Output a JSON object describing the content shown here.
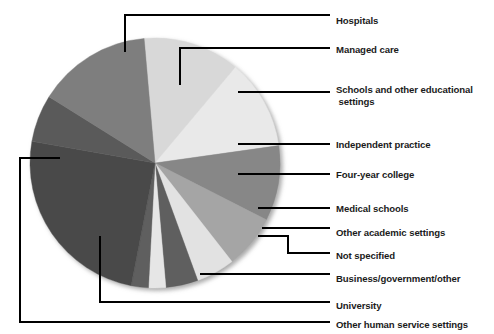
{
  "figure": {
    "background_color": "#ffffff",
    "text_color": "#1b1b1b",
    "leader_line_color": "#000000"
  },
  "chart_data": {
    "type": "pie",
    "title": "",
    "subtitle": "",
    "xlabel": "",
    "ylabel": "",
    "legend_position": "right-callouts",
    "grid": false,
    "start_angle_deg": -90,
    "direction": "counterclockwise",
    "center_px": [
      155,
      163
    ],
    "radius_px": 125,
    "categories": [
      "Hospitals",
      "Managed care",
      "Schools and other educational settings",
      "Independent practice",
      "Four-year college",
      "Medical schools",
      "Other academic settings",
      "Not specified",
      "Business/government/other",
      "University",
      "Other human service settings"
    ],
    "values": [
      12,
      8,
      12,
      7,
      5,
      4,
      2,
      2,
      11,
      26,
      11
    ],
    "units": "percent",
    "slices": [
      {
        "label": "Hospitals",
        "value": 12,
        "color": "#d8d8d8",
        "start_deg": 265,
        "end_deg": 310
      },
      {
        "label": "Managed care",
        "value": 8,
        "color": "#e9e9e9",
        "start_deg": 310,
        "end_deg": 352
      },
      {
        "label": "Schools and other educational settings",
        "value": 12,
        "color": "#878787",
        "start_deg": 352,
        "end_deg": 27
      },
      {
        "label": "Independent practice",
        "value": 7,
        "color": "#a5a5a5",
        "start_deg": 27,
        "end_deg": 52
      },
      {
        "label": "Four-year college",
        "value": 5,
        "color": "#e2e2e2",
        "start_deg": 52,
        "end_deg": 70
      },
      {
        "label": "Medical schools",
        "value": 4,
        "color": "#5e5e5e",
        "start_deg": 70,
        "end_deg": 85
      },
      {
        "label": "Other academic settings",
        "value": 2,
        "color": "#e6e6e6",
        "start_deg": 85,
        "end_deg": 93
      },
      {
        "label": "Not specified",
        "value": 2,
        "color": "#5e5e5e",
        "start_deg": 93,
        "end_deg": 101
      },
      {
        "label": "Business/government/other",
        "value": 26,
        "color": "#4a4a4a",
        "start_deg": 101,
        "end_deg": 190
      },
      {
        "label": "University",
        "value": 11,
        "color": "#5a5a5a",
        "start_deg": 190,
        "end_deg": 212
      },
      {
        "label": "Other human service settings",
        "value": 11,
        "color": "#7e7e7e",
        "start_deg": 212,
        "end_deg": 265
      }
    ]
  },
  "callouts": [
    {
      "key": "hospitals",
      "label": "Hospitals",
      "text_x": 336,
      "text_y": 15
    },
    {
      "key": "managed-care",
      "label": "Managed care",
      "text_x": 336,
      "text_y": 44
    },
    {
      "key": "schools",
      "label": "Schools and other educational",
      "label2": " settings",
      "text_x": 336,
      "text_y": 84
    },
    {
      "key": "independent-practice",
      "label": "Independent practice",
      "text_x": 336,
      "text_y": 139
    },
    {
      "key": "four-year-college",
      "label": "Four-year college",
      "text_x": 336,
      "text_y": 169
    },
    {
      "key": "medical-schools",
      "label": "Medical schools",
      "text_x": 336,
      "text_y": 203
    },
    {
      "key": "other-academic",
      "label": "Other academic settings",
      "text_x": 336,
      "text_y": 227
    },
    {
      "key": "not-specified",
      "label": "Not specified",
      "text_x": 336,
      "text_y": 250
    },
    {
      "key": "business-gov-other",
      "label": "Business/government/other",
      "text_x": 336,
      "text_y": 273
    },
    {
      "key": "university",
      "label": "University",
      "text_x": 336,
      "text_y": 300
    },
    {
      "key": "other-human-service",
      "label": "Other human service settings",
      "text_x": 336,
      "text_y": 319
    }
  ]
}
